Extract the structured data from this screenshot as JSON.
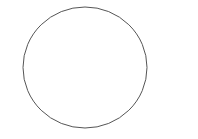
{
  "canvas": {
    "width": 198,
    "height": 139,
    "background": "#ffffff"
  },
  "shapes": [
    {
      "type": "circle",
      "cx": 85,
      "cy": 67.5,
      "rx": 62,
      "ry": 60.5,
      "stroke": "#555555",
      "stroke_width": 1,
      "fill": "none"
    }
  ]
}
